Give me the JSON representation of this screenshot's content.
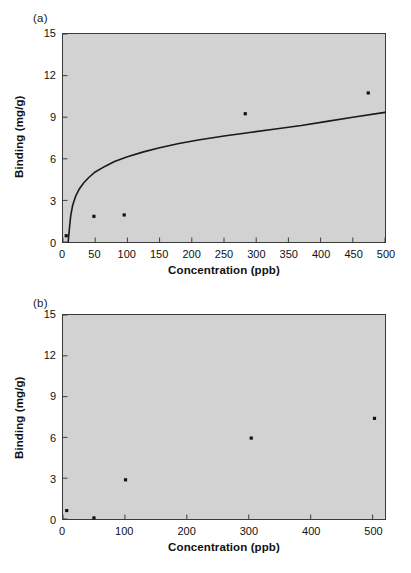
{
  "figure": {
    "background": "#ffffff",
    "plot_background": "#d2d2d2",
    "axis_color": "#3a3a3a",
    "marker_color": "#111111",
    "curve_color": "#1a1a1a"
  },
  "panels": [
    {
      "id": "a",
      "label": "(a)",
      "chart_data": {
        "type": "scatter",
        "title": "",
        "xlabel": "Concentration (ppb)",
        "ylabel": "Binding (mg/g)",
        "xlim": [
          0,
          500
        ],
        "ylim": [
          0,
          15
        ],
        "xticks": [
          0,
          50,
          100,
          150,
          200,
          250,
          300,
          350,
          400,
          450,
          500
        ],
        "yticks": [
          0,
          3,
          6,
          9,
          12,
          15
        ],
        "grid": false,
        "legend": "none",
        "series": [
          {
            "name": "Binding data",
            "marker": "filled-square",
            "points": [
              {
                "x": 5,
                "y": 0.45
              },
              {
                "x": 48,
                "y": 1.85
              },
              {
                "x": 95,
                "y": 1.95
              },
              {
                "x": 283,
                "y": 9.25
              },
              {
                "x": 474,
                "y": 10.75
              }
            ]
          },
          {
            "name": "Fitted isotherm curve",
            "marker": "line",
            "points": [
              {
                "x": 8,
                "y": 0.0
              },
              {
                "x": 10,
                "y": 1.0
              },
              {
                "x": 12,
                "y": 1.9
              },
              {
                "x": 15,
                "y": 2.65
              },
              {
                "x": 20,
                "y": 3.35
              },
              {
                "x": 25,
                "y": 3.8
              },
              {
                "x": 32,
                "y": 4.25
              },
              {
                "x": 40,
                "y": 4.65
              },
              {
                "x": 50,
                "y": 5.05
              },
              {
                "x": 65,
                "y": 5.45
              },
              {
                "x": 80,
                "y": 5.8
              },
              {
                "x": 100,
                "y": 6.15
              },
              {
                "x": 125,
                "y": 6.5
              },
              {
                "x": 150,
                "y": 6.8
              },
              {
                "x": 180,
                "y": 7.1
              },
              {
                "x": 210,
                "y": 7.35
              },
              {
                "x": 250,
                "y": 7.65
              },
              {
                "x": 290,
                "y": 7.9
              },
              {
                "x": 330,
                "y": 8.15
              },
              {
                "x": 370,
                "y": 8.4
              },
              {
                "x": 410,
                "y": 8.7
              },
              {
                "x": 450,
                "y": 9.0
              },
              {
                "x": 500,
                "y": 9.35
              }
            ]
          }
        ]
      }
    },
    {
      "id": "b",
      "label": "(b)",
      "chart_data": {
        "type": "scatter",
        "title": "",
        "xlabel": "Concentration (ppb)",
        "ylabel": "Binding (mg/g)",
        "xlim": [
          0,
          520
        ],
        "ylim": [
          0,
          15
        ],
        "xticks": [
          0,
          100,
          200,
          300,
          400,
          500
        ],
        "yticks": [
          0,
          3,
          6,
          9,
          12,
          15
        ],
        "grid": false,
        "legend": "none",
        "series": [
          {
            "name": "Binding data",
            "marker": "filled-square",
            "points": [
              {
                "x": 6,
                "y": 0.62
              },
              {
                "x": 50,
                "y": 0.08
              },
              {
                "x": 101,
                "y": 2.88
              },
              {
                "x": 304,
                "y": 5.95
              },
              {
                "x": 503,
                "y": 7.4
              }
            ]
          }
        ]
      }
    }
  ]
}
